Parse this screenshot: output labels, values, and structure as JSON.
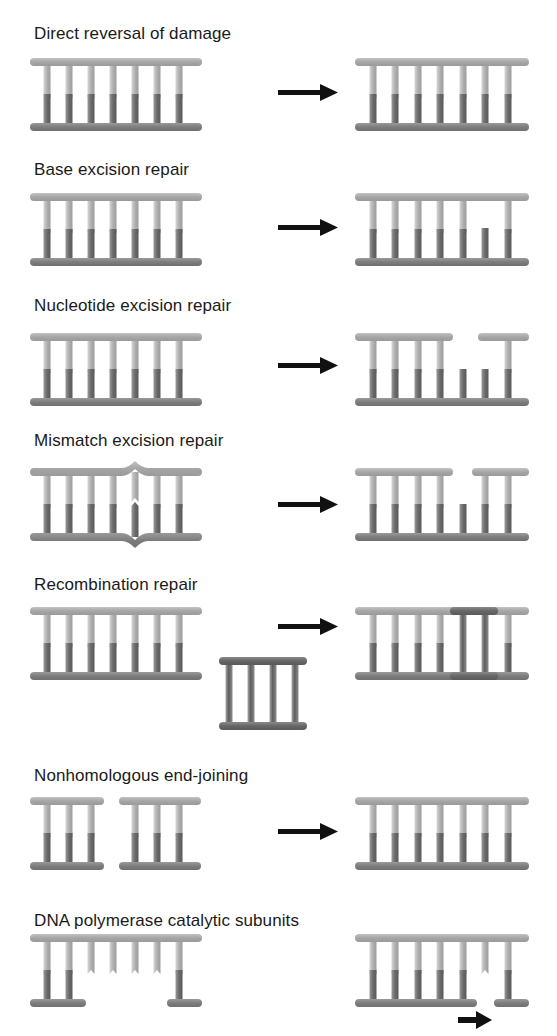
{
  "colors": {
    "strand_light": "#a9a9a9",
    "strand_dark": "#808080",
    "rung_light": "#b4b4b4",
    "rung_dark": "#6e6e6e",
    "repair_patch": "#6a6a6a",
    "arrow": "#111111"
  },
  "sections": [
    {
      "id": "direct-reversal",
      "title": "Direct reversal of damage"
    },
    {
      "id": "base-excision",
      "title": "Base excision repair"
    },
    {
      "id": "nucleotide-excision",
      "title": "Nucleotide excision repair"
    },
    {
      "id": "mismatch-excision",
      "title": "Mismatch excision repair"
    },
    {
      "id": "recombination",
      "title": "Recombination repair"
    },
    {
      "id": "nhej",
      "title": "Nonhomologous end-joining"
    },
    {
      "id": "dna-polymerase",
      "title": "DNA polymerase catalytic subunits"
    }
  ]
}
